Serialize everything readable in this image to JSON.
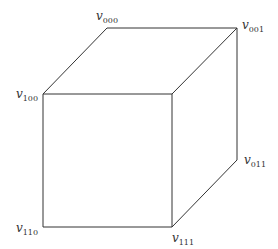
{
  "diagram": {
    "type": "cube",
    "vertices": [
      {
        "id": "v000",
        "base": "v",
        "sub": "000",
        "x": 107,
        "y": 28,
        "label_x": 96,
        "label_y": 20
      },
      {
        "id": "v001",
        "base": "v",
        "sub": "001",
        "x": 237,
        "y": 28,
        "label_x": 242,
        "label_y": 29
      },
      {
        "id": "v100",
        "base": "v",
        "sub": "100",
        "x": 43,
        "y": 94,
        "label_x": 16,
        "label_y": 98
      },
      {
        "id": "v101",
        "base": "",
        "sub": "",
        "x": 172,
        "y": 94
      },
      {
        "id": "v011",
        "base": "v",
        "sub": "011",
        "x": 237,
        "y": 160,
        "label_x": 244,
        "label_y": 164
      },
      {
        "id": "v110",
        "base": "v",
        "sub": "110",
        "x": 43,
        "y": 227,
        "label_x": 16,
        "label_y": 232
      },
      {
        "id": "v111",
        "base": "v",
        "sub": "111",
        "x": 172,
        "y": 227,
        "label_x": 172,
        "label_y": 242
      }
    ],
    "edges": [
      [
        "v000",
        "v001"
      ],
      [
        "v000",
        "v100"
      ],
      [
        "v001",
        "v101"
      ],
      [
        "v001",
        "v011"
      ],
      [
        "v100",
        "v101"
      ],
      [
        "v100",
        "v110"
      ],
      [
        "v101",
        "v111"
      ],
      [
        "v110",
        "v111"
      ],
      [
        "v011",
        "v111"
      ]
    ],
    "line_color": "#333333"
  }
}
